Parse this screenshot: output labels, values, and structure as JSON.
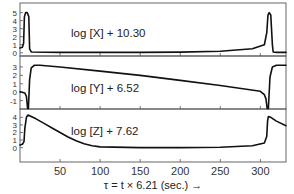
{
  "chart_data": {
    "type": "line",
    "title": "",
    "xlabel": "τ = t × 6.21 (sec.) →",
    "xlim": [
      0,
      332
    ],
    "x_ticks": [
      50,
      100,
      150,
      200,
      250,
      300
    ],
    "x_tick_labels": [
      "50",
      "100",
      "150",
      "200",
      "250",
      "300"
    ],
    "grid": false,
    "legend": "none",
    "panels": [
      {
        "name": "X",
        "label": "log [X] + 10.30",
        "ylim": [
          -0.4,
          6.2
        ],
        "y_ticks": [
          0,
          1,
          2,
          3,
          4,
          5
        ],
        "y_tick_labels": [
          "0",
          "1",
          "2",
          "3",
          "4",
          "5"
        ],
        "x": [
          0,
          3,
          4.5,
          5.5,
          7,
          9,
          11,
          12,
          14,
          50,
          100,
          150,
          200,
          250,
          290,
          305,
          308,
          309.5,
          311,
          313,
          315,
          316,
          320,
          332
        ],
        "y": [
          0.6,
          0.7,
          1.2,
          4.5,
          5.0,
          5.0,
          4.5,
          0.5,
          0.1,
          0.05,
          0.05,
          0.05,
          0.08,
          0.2,
          0.5,
          1.0,
          2.5,
          4.7,
          5.0,
          4.7,
          1.0,
          0.1,
          0.05,
          0.05
        ]
      },
      {
        "name": "Y",
        "label": "log [Y] + 6.52",
        "ylim": [
          -2.0,
          4.3
        ],
        "y_ticks": [
          -1,
          0,
          1,
          2,
          3
        ],
        "y_tick_labels": [
          "-1",
          "0",
          "1",
          "2",
          "3"
        ],
        "x": [
          0,
          6,
          8,
          9.5,
          10.5,
          12,
          14,
          18,
          25,
          50,
          100,
          150,
          200,
          250,
          300,
          305,
          307,
          308.5,
          310,
          312,
          315,
          320,
          332
        ],
        "y": [
          0.05,
          -0.1,
          -0.5,
          -2.0,
          -2.0,
          1.5,
          2.9,
          3.2,
          3.2,
          3.0,
          2.5,
          2.0,
          1.4,
          0.8,
          0.1,
          -0.3,
          -0.8,
          -2.0,
          -2.0,
          1.8,
          3.0,
          3.2,
          3.2
        ]
      },
      {
        "name": "Z",
        "label": "log [Z] + 7.62",
        "ylim": [
          -1.9,
          5.1
        ],
        "y_ticks": [
          0,
          1,
          2,
          3,
          4
        ],
        "y_tick_labels": [
          "0",
          "1",
          "2",
          "3",
          "4"
        ],
        "x": [
          0,
          3,
          5,
          6,
          8,
          10,
          12,
          20,
          30,
          40,
          50,
          60,
          70,
          80,
          90,
          100,
          150,
          200,
          250,
          290,
          305,
          308,
          309,
          310,
          313,
          320,
          332
        ],
        "y": [
          0.35,
          0.45,
          0.8,
          2.5,
          4.0,
          4.3,
          4.2,
          3.8,
          3.2,
          2.6,
          2.0,
          1.4,
          0.9,
          0.5,
          0.25,
          0.1,
          0.0,
          0.0,
          0.05,
          0.25,
          0.6,
          1.5,
          3.5,
          4.1,
          4.0,
          3.5,
          2.9
        ]
      }
    ]
  }
}
